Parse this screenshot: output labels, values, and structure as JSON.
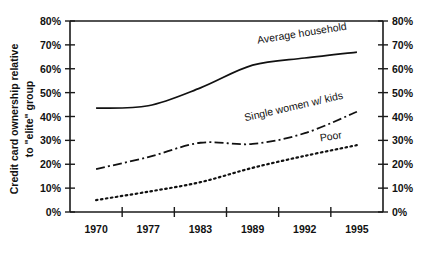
{
  "chart_data": {
    "type": "line",
    "title": "",
    "xlabel": "",
    "ylabel": "Credit card ownership relative to \"elite\" group",
    "ylabel_line1": "Credit card ownership relative",
    "ylabel_line2": "to \"elite\" group",
    "categories": [
      "1970",
      "1977",
      "1983",
      "1989",
      "1992",
      "1995"
    ],
    "ylim": [
      0,
      80
    ],
    "ytick_values": [
      0,
      10,
      20,
      30,
      40,
      50,
      60,
      70,
      80
    ],
    "ytick_labels": [
      "0%",
      "10%",
      "20%",
      "30%",
      "40%",
      "50%",
      "60%",
      "70%",
      "80%"
    ],
    "right_axis": true,
    "right_ytick_labels": [
      "0%",
      "10%",
      "20%",
      "30%",
      "40%",
      "50%",
      "60%",
      "70%",
      "80%"
    ],
    "grid": false,
    "legend_position": "inline-annotations",
    "series": [
      {
        "name": "Average household",
        "line_style": "solid",
        "label_rotation_deg": -9,
        "values": [
          43.5,
          44.5,
          52.0,
          61.5,
          64.5,
          67.0
        ]
      },
      {
        "name": "Single women w/ kids",
        "line_style": "dash-dot",
        "label_rotation_deg": -13,
        "values": [
          18.0,
          23.0,
          29.0,
          28.5,
          33.0,
          42.0
        ]
      },
      {
        "name": "Poor",
        "line_style": "dotted",
        "label_rotation_deg": -9,
        "values": [
          5.0,
          8.5,
          12.5,
          18.5,
          23.5,
          28.0
        ]
      }
    ],
    "annotations": [
      {
        "text": "Average household",
        "x_frac": 0.6,
        "y_value": 70.5
      },
      {
        "text": "Single women w/ kids",
        "x_frac": 0.56,
        "y_value": 38.0
      },
      {
        "text": "Poor",
        "x_frac": 0.8,
        "y_value": 29.5
      }
    ]
  }
}
